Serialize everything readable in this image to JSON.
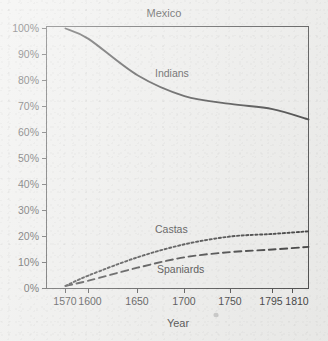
{
  "chart_data": {
    "type": "line",
    "title": "Mexico",
    "subtitle": "",
    "xlabel": "Year",
    "ylabel": "",
    "xlim": [
      1570,
      1810
    ],
    "ylim": [
      0,
      100
    ],
    "grid": false,
    "legend_position": "inline-labels",
    "xticks": [
      1570,
      1600,
      1650,
      1700,
      1750,
      1795,
      1810
    ],
    "xtick_labels": [
      "1570",
      "1600",
      "1650",
      "1700",
      "1750",
      "1795",
      "1810"
    ],
    "yticks": [
      0,
      10,
      20,
      30,
      40,
      50,
      60,
      70,
      80,
      90,
      100
    ],
    "ytick_labels": [
      "0%",
      "10%",
      "20%",
      "30%",
      "40%",
      "50%",
      "60%",
      "70%",
      "80%",
      "90%",
      "100%"
    ],
    "x": [
      1570,
      1600,
      1650,
      1700,
      1750,
      1795,
      1810
    ],
    "series": [
      {
        "name": "Indians",
        "style": "solid",
        "color": "#3b3b3b",
        "values": [
          100,
          96,
          82,
          74,
          71,
          69,
          65
        ]
      },
      {
        "name": "Castas",
        "style": "dotted",
        "color": "#3b3b3b",
        "values": [
          1,
          5,
          12,
          17,
          20,
          21,
          22
        ]
      },
      {
        "name": "Spaniards",
        "style": "dashed",
        "color": "#3b3b3b",
        "values": [
          1,
          3,
          8,
          12,
          14,
          15,
          16
        ]
      }
    ],
    "annotations": [
      {
        "text": "Indians",
        "x": 1660,
        "y": 80
      },
      {
        "text": "Castas",
        "x": 1660,
        "y": 25
      },
      {
        "text": "Spaniards",
        "x": 1665,
        "y": 10
      }
    ]
  },
  "axis": {
    "y_labels": [
      "100%",
      "90%",
      "80%",
      "70%",
      "60%",
      "50%",
      "40%",
      "30%",
      "20%",
      "10%",
      "0%"
    ],
    "x_labels": [
      "1570",
      "1600",
      "1650",
      "1700",
      "1750",
      "1795",
      "1810"
    ],
    "x_axis_title": "Year"
  },
  "title": {
    "text": "Mexico"
  },
  "labels": {
    "indians": "Indians",
    "castas": "Castas",
    "spaniards": "Spaniards"
  },
  "colors": {
    "background": "#ececea",
    "ink": "#3b3b3b",
    "frame": "#4a4a4a"
  }
}
